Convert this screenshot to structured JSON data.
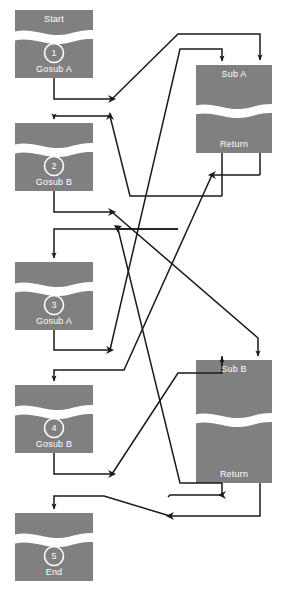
{
  "diagram": {
    "colors": {
      "node_fill": "#808080",
      "wave": "#ffffff",
      "line": "#1a1a1a",
      "text": "#ffffff",
      "background": "#ffffff"
    },
    "main_nodes": [
      {
        "id": "n1",
        "number": "1",
        "top_label": "Start",
        "bottom_label": "Gosub A",
        "x": 15,
        "y": 10,
        "w": 78,
        "h": 68
      },
      {
        "id": "n2",
        "number": "2",
        "top_label": "",
        "bottom_label": "Gosub B",
        "x": 15,
        "y": 123,
        "w": 78,
        "h": 68
      },
      {
        "id": "n3",
        "number": "3",
        "top_label": "",
        "bottom_label": "Gosub A",
        "x": 15,
        "y": 262,
        "w": 78,
        "h": 68
      },
      {
        "id": "n4",
        "number": "4",
        "top_label": "",
        "bottom_label": "Gosub B",
        "x": 15,
        "y": 385,
        "w": 78,
        "h": 68
      },
      {
        "id": "n5",
        "number": "5",
        "top_label": "",
        "bottom_label": "End",
        "x": 15,
        "y": 513,
        "w": 78,
        "h": 68
      }
    ],
    "sub_nodes": [
      {
        "id": "subA",
        "top_label": "Sub A",
        "bottom_label": "Return",
        "x": 196,
        "y": 65,
        "w": 76,
        "h": 88
      },
      {
        "id": "subB",
        "top_label": "Sub B",
        "bottom_label": "Return",
        "x": 196,
        "y": 360,
        "w": 76,
        "h": 123
      }
    ],
    "edges": [
      {
        "name": "n1-to-subA",
        "from": "n1",
        "to": "subA"
      },
      {
        "name": "subA-to-n2",
        "from": "subA",
        "to": "n2"
      },
      {
        "name": "n2-to-subB",
        "from": "n2",
        "to": "subB"
      },
      {
        "name": "subB-to-n3",
        "from": "subB",
        "to": "n3"
      },
      {
        "name": "n3-to-subA",
        "from": "n3",
        "to": "subA"
      },
      {
        "name": "subA-to-n4",
        "from": "subA",
        "to": "n4"
      },
      {
        "name": "n4-to-subB",
        "from": "n4",
        "to": "subB"
      },
      {
        "name": "subB-to-n5",
        "from": "subB",
        "to": "n5"
      }
    ]
  }
}
